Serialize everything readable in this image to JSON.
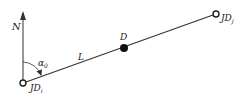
{
  "diagram": {
    "labels": {
      "north": "N",
      "angle": "α",
      "angle_sub": "0",
      "segment": "L",
      "midpoint": "D",
      "start": "JD",
      "start_sub": "i",
      "end": "JD",
      "end_sub": "j"
    },
    "colors": {
      "stroke": "#333333",
      "fill_point": "#111111",
      "background": "#ffffff"
    }
  }
}
